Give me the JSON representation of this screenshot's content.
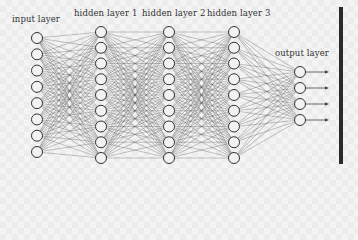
{
  "diagram": {
    "type": "feedforward-neural-network",
    "layers": [
      {
        "label": "input layer",
        "x": 37,
        "nodes": 8,
        "y_top": 38,
        "y_bottom": 152,
        "label_x": 12,
        "label_y": 14
      },
      {
        "label": "hidden layer 1",
        "x": 101,
        "nodes": 9,
        "y_top": 32,
        "y_bottom": 158,
        "label_x": 74,
        "label_y": 8
      },
      {
        "label": "hidden layer 2",
        "x": 169,
        "nodes": 9,
        "y_top": 32,
        "y_bottom": 158,
        "label_x": 142,
        "label_y": 8
      },
      {
        "label": "hidden layer 3",
        "x": 234,
        "nodes": 9,
        "y_top": 32,
        "y_bottom": 158,
        "label_x": 207,
        "label_y": 8
      },
      {
        "label": "output layer",
        "x": 300,
        "nodes": 4,
        "y_top": 72,
        "y_bottom": 120,
        "label_x": 275,
        "label_y": 48
      }
    ],
    "node_radius": 5.5,
    "output_arrows": 4,
    "colors": {
      "edge": "#555555",
      "node_stroke": "#333333",
      "node_fill": "#f2f2f2",
      "bar": "#2a2a2a",
      "text": "#333333"
    }
  }
}
